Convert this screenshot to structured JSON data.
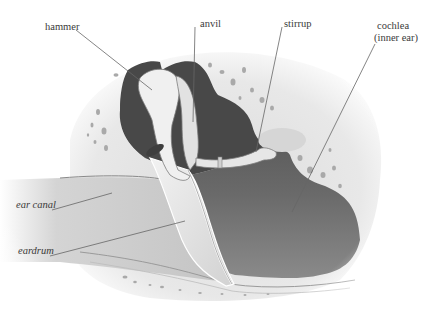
{
  "diagram": {
    "colors": {
      "background": "#ffffff",
      "bone": "#e6e6e6",
      "cavity_dark": "#555555",
      "ossicle": "#ececec",
      "canal": "#c9c9c9",
      "eardrum": "#e3e3e3",
      "leader_line": "#666666",
      "label_text": "#3a3a3a"
    },
    "labels": [
      {
        "id": "hammer",
        "text": "hammer",
        "points_to": [
          150,
          90
        ]
      },
      {
        "id": "anvil",
        "text": "anvil",
        "points_to": [
          193,
          120
        ]
      },
      {
        "id": "stirrup",
        "text": "stirrup",
        "points_to": [
          256,
          150
        ]
      },
      {
        "id": "cochlea",
        "text": "cochlea",
        "text2": "(inner ear)",
        "points_to": [
          292,
          210
        ]
      },
      {
        "id": "ear_canal",
        "text": "ear canal",
        "points_to": [
          112,
          193
        ]
      },
      {
        "id": "eardrum",
        "text": "eardrum",
        "points_to": [
          185,
          220
        ]
      }
    ]
  }
}
